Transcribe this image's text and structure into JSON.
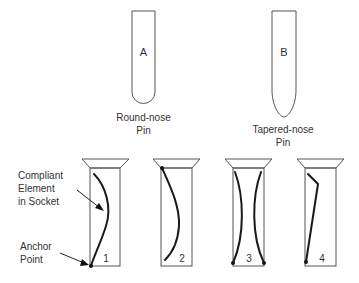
{
  "pins": [
    {
      "id": "A",
      "letter": "A",
      "caption_line1": "Round-nose",
      "caption_line2": "Pin",
      "nose": "round"
    },
    {
      "id": "B",
      "letter": "B",
      "caption_line1": "Tapered-nose",
      "caption_line2": "Pin",
      "nose": "tapered"
    }
  ],
  "sockets": [
    {
      "number": "1",
      "element": "single curved element anchored at bottom-left"
    },
    {
      "number": "2",
      "element": "single curved element anchored at top-left"
    },
    {
      "number": "3",
      "element": "two opposing curved elements anchored at bottom corners"
    },
    {
      "number": "4",
      "element": "single bent straight element anchored at bottom-left"
    }
  ],
  "callouts": {
    "compliant_line1": "Compliant",
    "compliant_line2": "Element",
    "compliant_line3": "in Socket",
    "anchor_line1": "Anchor",
    "anchor_line2": "Point"
  },
  "colors": {
    "outline": "#555555",
    "element": "#1a1a1a",
    "text": "#333333"
  }
}
